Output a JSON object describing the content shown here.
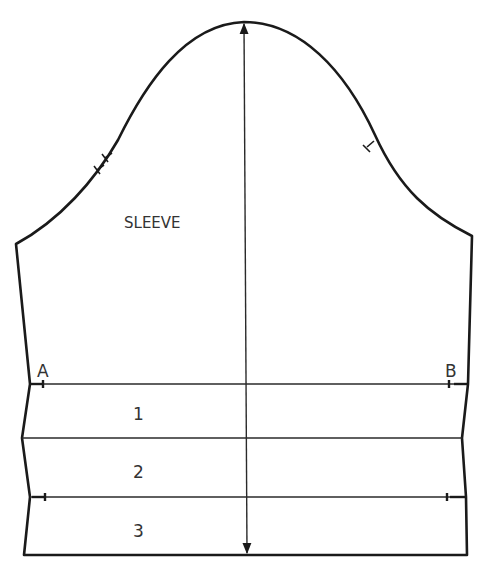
{
  "diagram": {
    "title_label": "SLEEVE",
    "point_labels": {
      "left": "A",
      "right": "B"
    },
    "band_labels": [
      "1",
      "2",
      "3"
    ],
    "grainline": {
      "type": "double-arrow",
      "orientation": "vertical"
    },
    "notches": {
      "back": 2,
      "front": 1
    },
    "colors": {
      "line": "#1a1a1a",
      "background": "#ffffff",
      "text": "#333333"
    }
  }
}
